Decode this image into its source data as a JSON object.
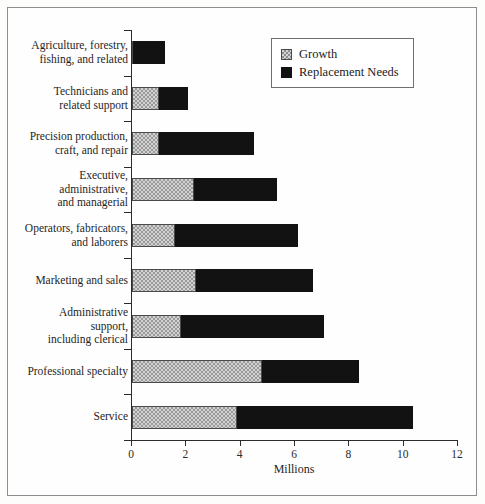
{
  "chart_data": {
    "type": "bar",
    "orientation": "horizontal",
    "stacked": true,
    "title": "",
    "xlabel": "Millions",
    "ylabel": "",
    "xlim": [
      0,
      12
    ],
    "xticks": [
      0,
      2,
      4,
      6,
      8,
      10,
      12
    ],
    "xtick_labels": [
      "0",
      "2",
      "4",
      "6",
      "8",
      "10",
      "12"
    ],
    "grid": false,
    "legend": {
      "position": "top-right",
      "entries": [
        {
          "name": "Growth",
          "swatch": "growth"
        },
        {
          "name": "Replacement Needs",
          "swatch": "replacement"
        }
      ]
    },
    "categories": [
      "Agriculture, forestry,\nfishing, and related",
      "Technicians and\nrelated support",
      "Precision production,\ncraft, and repair",
      "Executive,\nadministrative,\nand managerial",
      "Operators, fabricators,\nand laborers",
      "Marketing and sales",
      "Administrative\nsupport,\nincluding clerical",
      "Professional specialty",
      "Service"
    ],
    "series": [
      {
        "name": "Growth",
        "values": [
          0.05,
          1.0,
          1.0,
          2.3,
          1.6,
          2.35,
          1.8,
          4.8,
          3.85
        ]
      },
      {
        "name": "Replacement Needs",
        "values": [
          1.15,
          1.05,
          3.5,
          3.05,
          4.5,
          4.3,
          5.25,
          3.55,
          6.5
        ]
      }
    ],
    "totals": [
      1.2,
      2.05,
      4.5,
      5.35,
      6.1,
      6.65,
      7.05,
      8.35,
      10.35
    ]
  },
  "colors": {
    "growth": "#d2d2d2",
    "replacement": "#121212",
    "axis": "#2b2b2b",
    "frame": "#8d8d8d",
    "text": "#1f1f1f"
  }
}
